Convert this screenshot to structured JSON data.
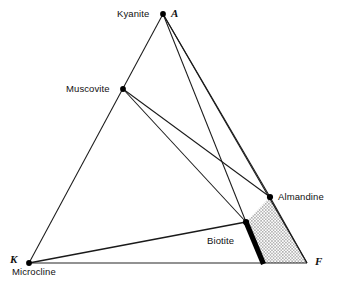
{
  "diagram": {
    "type": "akf-ternary-compatibility-diagram",
    "background_color": "#ffffff",
    "line_color": "#1a1a1a",
    "stipple_color": "#555555",
    "band_color": "#000000",
    "vertices": [
      {
        "key": "A",
        "label": "A",
        "x": 163,
        "y": 14,
        "label_x": 171,
        "label_y": 8
      },
      {
        "key": "K",
        "label": "K",
        "x": 29,
        "y": 263,
        "label_x": 10,
        "label_y": 254
      },
      {
        "key": "F",
        "label": "F",
        "x": 307,
        "y": 263,
        "label_x": 315,
        "label_y": 256
      }
    ],
    "mineral_points": [
      {
        "name": "Kyanite",
        "x": 163,
        "y": 14,
        "label_x": 117,
        "label_y": 9,
        "anchor": "left"
      },
      {
        "name": "Muscovite",
        "x": 123,
        "y": 89,
        "label_x": 66,
        "label_y": 84,
        "anchor": "left"
      },
      {
        "name": "Almandine",
        "x": 270,
        "y": 197,
        "label_x": 278,
        "label_y": 192,
        "anchor": "left"
      },
      {
        "name": "Biotite",
        "x": 246,
        "y": 222,
        "label_x": 207,
        "label_y": 236,
        "anchor": "left"
      },
      {
        "name": "Microcline",
        "x": 29,
        "y": 263,
        "label_x": 12,
        "label_y": 267,
        "anchor": "left"
      }
    ],
    "tie_lines": [
      {
        "from": "A",
        "to": "K",
        "weight": 1.0
      },
      {
        "from": "K",
        "to": "F",
        "weight": 0.9
      },
      {
        "from": "A",
        "to": "F",
        "weight": 1.0
      },
      {
        "from": "A",
        "to": "Almandine",
        "weight": 1.0
      },
      {
        "from": "A",
        "to": "Biotite",
        "weight": 1.0
      },
      {
        "from": "Muscovite",
        "to": "Almandine",
        "weight": 1.0
      },
      {
        "from": "Muscovite",
        "to": "Biotite",
        "weight": 1.0
      },
      {
        "from": "K",
        "to": "Biotite",
        "weight": 1.2
      }
    ],
    "stippled_field": {
      "name": "three-phase-field",
      "points": "270,197 246,222 263,263 307,263",
      "fill": "stipple-dots"
    },
    "thick_band": {
      "name": "biotite-almandine-band",
      "from_x": 246,
      "from_y": 222,
      "to_x": 263,
      "to_y": 263,
      "width": 5
    }
  }
}
